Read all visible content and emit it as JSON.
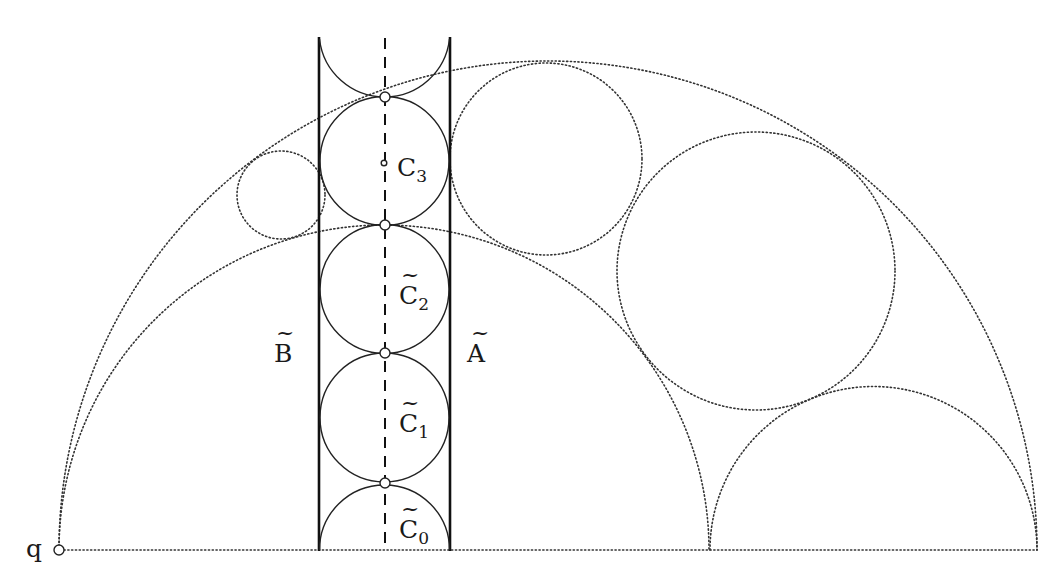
{
  "diagram": {
    "labels": {
      "q": "q",
      "C3": "C",
      "C3_sub": "3",
      "C2": "C",
      "C2_sub": "2",
      "C1": "C",
      "C1_sub": "1",
      "C0": "C",
      "C0_sub": "0",
      "B": "B",
      "A": "A",
      "tilde": "~"
    },
    "colors": {
      "background": "#ffffff",
      "stroke": "#222222"
    }
  }
}
